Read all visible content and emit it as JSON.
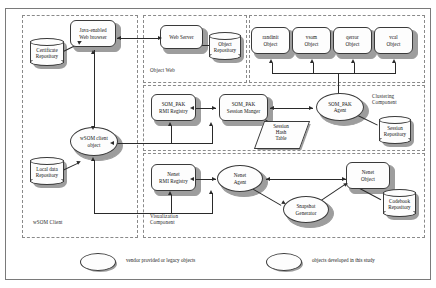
{
  "diagram": {
    "groups": [
      {
        "id": "wsom_client",
        "label": "wSOM Client"
      },
      {
        "id": "object_web",
        "label": "Object Web"
      },
      {
        "id": "clustering",
        "label": "Clustering\nComponent"
      },
      {
        "id": "visualization",
        "label": "Visualization\nComponent"
      }
    ],
    "nodes": {
      "java_browser": {
        "label": "Java-enabled\nWeb browser",
        "shape": "rounded-rect"
      },
      "web_server": {
        "label": "Web Server",
        "shape": "rounded-rect"
      },
      "wsom_client_object": {
        "label": "wSOM client\nobject",
        "shape": "ellipse"
      },
      "randinit_object": {
        "label": "randinit\nObject",
        "shape": "rounded-rect"
      },
      "vsom_object": {
        "label": "vsom\nObject",
        "shape": "rounded-rect"
      },
      "qerror_object": {
        "label": "qerror\nObject",
        "shape": "rounded-rect"
      },
      "vcal_object": {
        "label": "vcal\nObject",
        "shape": "rounded-rect"
      },
      "sompak_rmi_registry": {
        "label": "SOM_PAK\nRMI Registry",
        "shape": "rounded-rect"
      },
      "sompak_session_mgr": {
        "label": "SOM_PAK\nSession Manger",
        "shape": "rounded-rect"
      },
      "sompak_agent": {
        "label": "SOM_PAK\nAgent",
        "shape": "ellipse"
      },
      "nenet_rmi_registry": {
        "label": "Nenet\nRMI Registry",
        "shape": "rounded-rect"
      },
      "nenet_agent": {
        "label": "Nenet\nAgent",
        "shape": "ellipse"
      },
      "nenet_object": {
        "label": "Nenet\nObject",
        "shape": "rounded-rect"
      },
      "snapshot_generator": {
        "label": "Snapshot\nGenerator",
        "shape": "ellipse"
      }
    },
    "repositories": {
      "certificate_repository": {
        "label": "Certificate\nRepository"
      },
      "object_repository": {
        "label": "Object\nRepository"
      },
      "local_data_repository": {
        "label": "Local data\nRepository"
      },
      "session_repository": {
        "label": "Session\nRepository"
      },
      "codebook_repository": {
        "label": "Codebook\nRepository"
      }
    },
    "datastores": {
      "session_hash_table": {
        "label": "Session\nHash\nTable",
        "shape": "parallelogram"
      }
    },
    "legend": [
      {
        "id": "legacy",
        "label": "vendor provided or legacy objects"
      },
      {
        "id": "new",
        "label": "objects developed in this study"
      }
    ],
    "colors": {
      "line": "#2a2a2a",
      "node_fill": "#fdfdfd",
      "node_stroke": "#3a3a3a",
      "shadow": "#9d9d9d",
      "group_border": "#8a8a8a",
      "frame": "#7a7a7a",
      "background": "#ffffff"
    }
  }
}
